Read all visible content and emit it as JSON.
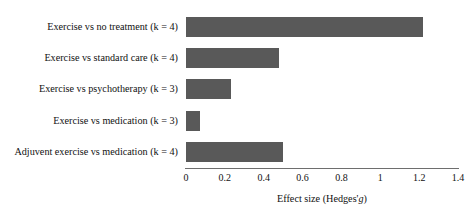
{
  "chart_data": {
    "type": "bar",
    "orientation": "horizontal",
    "title": "",
    "xlabel": "Effect size (Hedges' g)",
    "xlabel_parts": {
      "main": "Effect size (Hedges'",
      "italic": "g",
      "close": ")"
    },
    "ylabel": "",
    "categories": [
      "Exercise vs no treatment (k = 4)",
      "Exercise vs standard care (k = 4)",
      "Exercise vs psychotherapy (k = 3)",
      "Exercise vs medication (k = 3)",
      "Adjuvent exercise vs medication (k = 4)"
    ],
    "values": [
      1.22,
      0.48,
      0.23,
      0.07,
      0.5
    ],
    "xlim": [
      0,
      1.4
    ],
    "xticks": [
      0,
      0.2,
      0.4,
      0.6,
      0.8,
      1,
      1.2,
      1.4
    ],
    "xtick_labels": [
      "0",
      "0.2",
      "0.4",
      "0.6",
      "0.8",
      "1",
      "1.2",
      "1.4"
    ],
    "grid": false,
    "legend": null,
    "bar_color": "#595959",
    "axis_color": "#6e6e6e"
  }
}
